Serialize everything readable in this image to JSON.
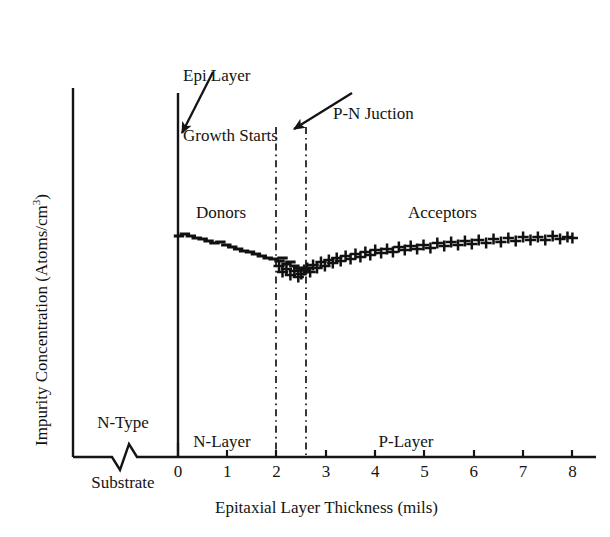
{
  "chart_data": {
    "type": "scatter",
    "title": "",
    "subtitle": "",
    "xlabel": "Epitaxial Layer Thickness (mils)",
    "ylabel": "Impurity Concentration (Atoms/cm",
    "ylabel_sup": "3",
    "ylabel_tail": ")",
    "xlim": [
      0,
      8
    ],
    "xticks": [
      0,
      1,
      2,
      3,
      4,
      5,
      6,
      7,
      8
    ],
    "xticklabels": [
      "0",
      "1",
      "2",
      "3",
      "4",
      "5",
      "6",
      "7",
      "8"
    ],
    "yticks": [],
    "yticklabels": [],
    "grid": false,
    "axis_break": true,
    "axis_break_note": "zigzag break on x-axis left of 0 separating substrate region",
    "legend": "inline text labels inside plot",
    "series": [
      {
        "name": "Donors",
        "marker": "minus",
        "label_x": 0.4,
        "label_y_px": 212,
        "x": [
          0.02,
          0.14,
          0.26,
          0.38,
          0.5,
          0.62,
          0.74,
          0.86,
          0.98,
          1.1,
          1.22,
          1.34,
          1.46,
          1.58,
          1.7,
          1.82,
          1.94,
          2.06,
          2.12,
          2.2,
          2.28,
          2.36,
          2.44,
          2.5
        ],
        "y_px": [
          236,
          234,
          236,
          238,
          239,
          241,
          243,
          242,
          245,
          247,
          249,
          251,
          252,
          254,
          256,
          258,
          259,
          261,
          258,
          264,
          262,
          266,
          268,
          270
        ]
      },
      {
        "name": "Acceptors",
        "marker": "plus",
        "label_x": 4.7,
        "label_y_px": 212,
        "x": [
          2.05,
          2.12,
          2.2,
          2.28,
          2.36,
          2.44,
          2.5,
          2.56,
          2.62,
          2.68,
          2.74,
          2.82,
          2.9,
          2.98,
          3.06,
          3.14,
          3.22,
          3.3,
          3.4,
          3.5,
          3.6,
          3.7,
          3.8,
          3.9,
          4.0,
          4.12,
          4.24,
          4.36,
          4.48,
          4.6,
          4.72,
          4.85,
          4.98,
          5.12,
          5.26,
          5.4,
          5.54,
          5.68,
          5.82,
          5.96,
          6.1,
          6.25,
          6.4,
          6.55,
          6.7,
          6.85,
          7.0,
          7.15,
          7.3,
          7.45,
          7.6,
          7.75,
          7.9,
          8.0
        ],
        "y_px": [
          266,
          272,
          269,
          275,
          271,
          277,
          274,
          270,
          268,
          272,
          265,
          268,
          262,
          266,
          260,
          263,
          258,
          261,
          256,
          259,
          254,
          257,
          252,
          255,
          250,
          253,
          249,
          252,
          247,
          250,
          246,
          249,
          245,
          248,
          243,
          246,
          242,
          245,
          241,
          244,
          240,
          243,
          239,
          242,
          238,
          241,
          237,
          240,
          237,
          240,
          236,
          239,
          237,
          238
        ]
      }
    ],
    "annotations": [
      {
        "name": "epi-growth-start",
        "text_line1": "Epi Layer",
        "text_line2": "Growth Starts",
        "text_x_px": 183,
        "text_y_px": 26,
        "arrow_from_px": [
          213,
          72
        ],
        "arrow_to_px": [
          180,
          135
        ]
      },
      {
        "name": "pn-junction",
        "text_line1": "P-N Juction",
        "text_line2": "",
        "text_x_px": 333,
        "text_y_px": 64,
        "arrow_from_px": [
          352,
          93
        ],
        "arrow_to_px": [
          292,
          130
        ]
      }
    ],
    "reference_lines": [
      {
        "name": "epi-start-line",
        "x": 0.0,
        "style": "solid",
        "from_y_px": 93,
        "to_y_px": 457
      },
      {
        "name": "junction-line-left",
        "x": 2.0,
        "style": "dash-dot",
        "from_y_px": 127,
        "to_y_px": 457
      },
      {
        "name": "junction-line-right",
        "x": 2.6,
        "style": "dash-dot",
        "from_y_px": 127,
        "to_y_px": 457
      }
    ],
    "region_labels": [
      {
        "name": "n-type-substrate",
        "line1": "N-Type",
        "line2": "Substrate",
        "x_px": 122,
        "y_px": 381
      },
      {
        "name": "n-layer",
        "line1": "N-Layer",
        "line2": "",
        "x_px": 222,
        "y_px": 400
      },
      {
        "name": "p-layer",
        "line1": "P-Layer",
        "line2": "",
        "x_px": 406,
        "y_px": 400
      }
    ]
  },
  "colors": {
    "ink": "#141414",
    "axis": "#141414",
    "background": "#ffffff",
    "marker": "#111111"
  }
}
